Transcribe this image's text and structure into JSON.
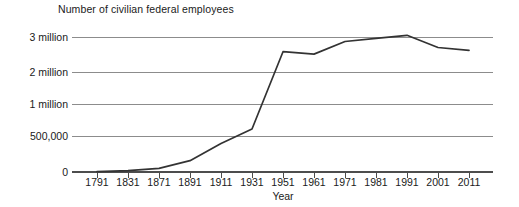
{
  "chart_data": {
    "type": "line",
    "title": "Number of civilian federal employees",
    "xlabel": "Year",
    "ylabel": "",
    "grid": true,
    "legend": null,
    "axis_note": "Y axis uses a broken / non-linear scale: the 0 to 500,000 and 500,000 to 1 million bands occupy similar vertical space as the 1-2 million and 2-3 million bands. X axis is categorical with uneven year intervals (40-year steps to 1871, 20-year steps to 1951, then 10-year steps).",
    "categories": [
      "1791",
      "1831",
      "1871",
      "1891",
      "1911",
      "1931",
      "1951",
      "1961",
      "1971",
      "1981",
      "1991",
      "2001",
      "2011"
    ],
    "ytick_labels": [
      "0",
      "500,000",
      "1 million",
      "2 million",
      "3 million"
    ],
    "ytick_values": [
      0,
      500000,
      1000000,
      2000000,
      3000000
    ],
    "values": [
      4500,
      20000,
      51000,
      157000,
      396000,
      610000,
      2580000,
      2510000,
      2870000,
      2960000,
      3050000,
      2700000,
      2620000
    ],
    "series": [
      {
        "name": "Civilian federal employees",
        "values": [
          4500,
          20000,
          51000,
          157000,
          396000,
          610000,
          2580000,
          2510000,
          2870000,
          2960000,
          3050000,
          2700000,
          2620000
        ]
      }
    ],
    "points": [
      {
        "year": "1791",
        "value": 4500
      },
      {
        "year": "1831",
        "value": 20000
      },
      {
        "year": "1871",
        "value": 51000
      },
      {
        "year": "1891",
        "value": 157000
      },
      {
        "year": "1911",
        "value": 396000
      },
      {
        "year": "1931",
        "value": 610000
      },
      {
        "year": "1951",
        "value": 2580000
      },
      {
        "year": "1961",
        "value": 2510000
      },
      {
        "year": "1971",
        "value": 2870000
      },
      {
        "year": "1981",
        "value": 2960000
      },
      {
        "year": "1991",
        "value": 3050000
      },
      {
        "year": "2001",
        "value": 2700000
      },
      {
        "year": "2011",
        "value": 2620000
      }
    ],
    "colors": {
      "line": "#333333",
      "grid": "#8c8c8c",
      "axis": "#595959",
      "text": "#1a1a1a",
      "background": "#ffffff"
    }
  }
}
